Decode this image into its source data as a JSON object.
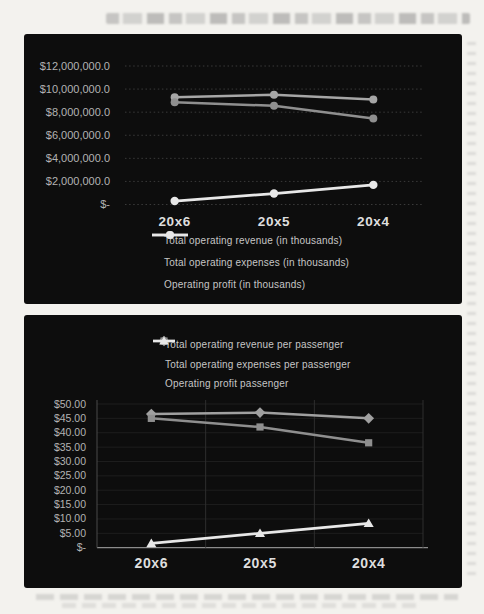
{
  "page": {
    "background_color": "#f3f2ee",
    "panel_background_color": "#0d0d0d",
    "tick_label_color": "#b3b3b3",
    "category_label_color": "#dedede",
    "legend_text_color": "#c6c6c6"
  },
  "chart_data": [
    {
      "type": "line",
      "title": "",
      "xlabel": "",
      "ylabel": "",
      "categories": [
        "20x6",
        "20x5",
        "20x4"
      ],
      "series": [
        {
          "name": "Total operating revenue (in thousands)",
          "marker": "circle",
          "color": "#a6a6a6",
          "values": [
            9300000,
            9500000,
            9100000
          ]
        },
        {
          "name": "Total operating expenses (in thousands)",
          "marker": "circle",
          "color": "#8f8f8f",
          "values": [
            8850000,
            8550000,
            7450000
          ]
        },
        {
          "name": "Operating profit (in thousands)",
          "marker": "circle",
          "color": "#e8e8e8",
          "values": [
            300000,
            950000,
            1700000
          ]
        }
      ],
      "ylim": [
        0,
        12000000
      ],
      "y_ticks": [
        {
          "value": 12000000,
          "label": "$12,000,000.0"
        },
        {
          "value": 10000000,
          "label": "$10,000,000.0"
        },
        {
          "value": 8000000,
          "label": "$8,000,000.0"
        },
        {
          "value": 6000000,
          "label": "$6,000,000.0"
        },
        {
          "value": 4000000,
          "label": "$4,000,000.0"
        },
        {
          "value": 2000000,
          "label": "$2,000,000.0"
        },
        {
          "value": 0,
          "label": "$-"
        }
      ],
      "grid": "horizontal-dotted",
      "legend_position": "bottom-left"
    },
    {
      "type": "line",
      "title": "",
      "xlabel": "",
      "ylabel": "",
      "categories": [
        "20x6",
        "20x5",
        "20x4"
      ],
      "series": [
        {
          "name": "Total operating revenue per passenger",
          "marker": "diamond",
          "color": "#a0a0a0",
          "values": [
            46.5,
            47.0,
            45.0
          ]
        },
        {
          "name": "Total operating expenses per passenger",
          "marker": "square",
          "color": "#8f8f8f",
          "values": [
            45.0,
            42.0,
            36.5
          ]
        },
        {
          "name": "Operating profit passenger",
          "marker": "triangle",
          "color": "#e8e8e8",
          "values": [
            1.5,
            5.0,
            8.5
          ]
        }
      ],
      "ylim": [
        0,
        50
      ],
      "y_ticks": [
        {
          "value": 50,
          "label": "$50.00"
        },
        {
          "value": 45,
          "label": "$45.00"
        },
        {
          "value": 40,
          "label": "$40.00"
        },
        {
          "value": 35,
          "label": "$35.00"
        },
        {
          "value": 30,
          "label": "$30.00"
        },
        {
          "value": 25,
          "label": "$25.00"
        },
        {
          "value": 20,
          "label": "$20.00"
        },
        {
          "value": 15,
          "label": "$15.00"
        },
        {
          "value": 10,
          "label": "$10.00"
        },
        {
          "value": 5,
          "label": "$5.00"
        },
        {
          "value": 0,
          "label": "$-"
        }
      ],
      "grid": "vertical",
      "legend_position": "top-center"
    }
  ]
}
